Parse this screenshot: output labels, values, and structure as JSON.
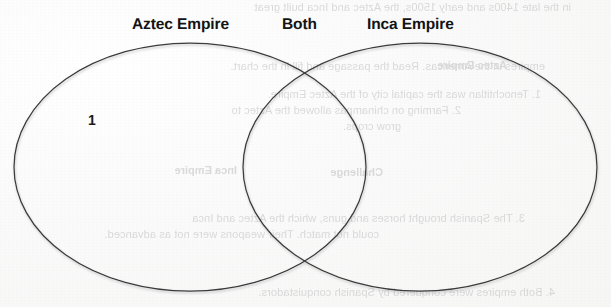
{
  "page": {
    "background_color": "#fbfbfa",
    "ink_color": "#131313",
    "stroke_color": "#3a3a3a"
  },
  "diagram": {
    "type": "venn",
    "headings": {
      "left": "Aztec Empire",
      "center": "Both",
      "right": "Inca Empire"
    },
    "left_circle": {
      "label": "Aztec Empire",
      "entries": [
        "1"
      ]
    },
    "overlap_region": {
      "label": "Both",
      "entries": []
    },
    "right_circle": {
      "label": "Inca Empire",
      "entries": []
    }
  },
  "annotations": {
    "number_one": "1"
  },
  "bleed_through": {
    "note": "faint mirrored text visible from the reverse side of the page",
    "lines": [
      "in the late 1400s and early 1500s, the Aztec and Inca built great",
      "empires in the Americas. Read the passage and fill in the chart.",
      "Aztec Empire",
      "1. Tenochtitlan was the capital city of the Aztec Empire.",
      "2. Farming on chinampas allowed the Aztec to",
      "grow crops.",
      "Inca Empire",
      "Challenge",
      "3. The Spanish brought horses and guns, which the Aztec and Inca",
      "could not match. Their weapons were not as advanced.",
      "4. Both empires were conquered by Spanish conquistadors."
    ]
  }
}
